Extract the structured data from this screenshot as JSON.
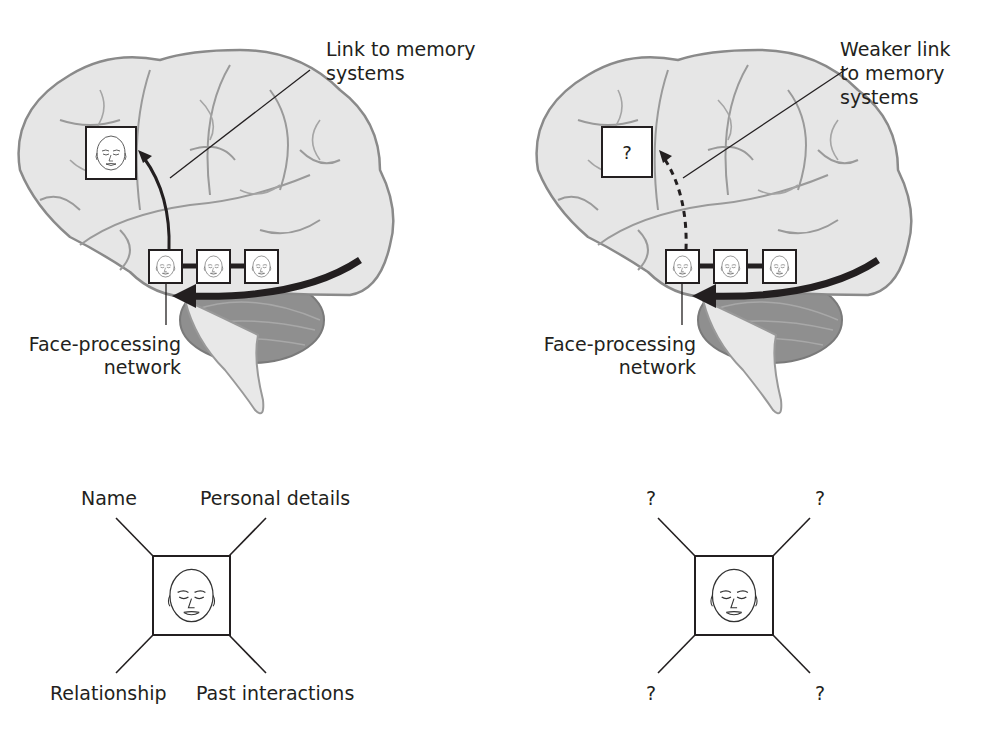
{
  "left_brain": {
    "link_label_line1": "Link to memory",
    "link_label_line2": "systems",
    "network_label_line1": "Face-processing",
    "network_label_line2": "network",
    "memory_box": "face"
  },
  "right_brain": {
    "link_label_line1": "Weaker link",
    "link_label_line2": "to memory",
    "link_label_line3": "systems",
    "network_label_line1": "Face-processing",
    "network_label_line2": "network",
    "memory_box": "?"
  },
  "left_face_map": {
    "top_left": "Name",
    "top_right": "Personal details",
    "bottom_left": "Relationship",
    "bottom_right": "Past interactions"
  },
  "right_face_map": {
    "top_left": "?",
    "top_right": "?",
    "bottom_left": "?",
    "bottom_right": "?"
  },
  "colors": {
    "brain_fill": "#e6e6e6",
    "brain_outline": "#8a8a8a",
    "cerebellum": "#8f8f8f",
    "ink": "#231f20"
  }
}
